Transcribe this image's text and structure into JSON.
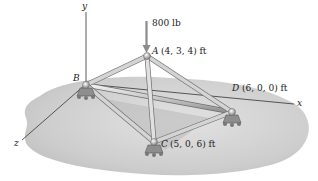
{
  "figure": {
    "type": "space-truss",
    "load": {
      "label": "800 lb",
      "direction": "down",
      "at_joint": "A"
    },
    "axes": {
      "x": "x",
      "y": "y",
      "z": "z"
    },
    "joints": [
      {
        "name": "A",
        "coords": "(4, 3, 4) ft"
      },
      {
        "name": "B",
        "coords": ""
      },
      {
        "name": "C",
        "coords": "(5, 0, 6) ft"
      },
      {
        "name": "D",
        "coords": "(6, 0, 0) ft"
      }
    ],
    "members": [
      "AB",
      "AC",
      "AD",
      "BC",
      "BD",
      "CD"
    ],
    "supports": [
      "B",
      "C",
      "D"
    ]
  },
  "colors": {
    "ground": "#cfcfcf",
    "ground_shadow": "#b5b5b5",
    "member": "#c9c9c9",
    "member_edge": "#6e6e6e",
    "axis": "#333333",
    "arrow": "#8a8a8a"
  }
}
